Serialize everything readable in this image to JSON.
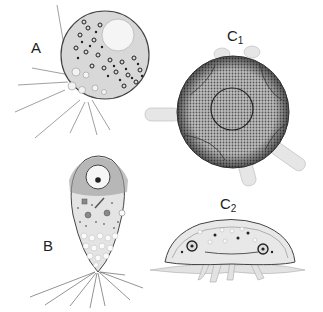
{
  "figure": {
    "panels": [
      {
        "id": "A",
        "label": "A",
        "subscript": "",
        "description": "spherical cell with dense granular cytoplasm, pale nucleus and radiating filopodia"
      },
      {
        "id": "B",
        "label": "B",
        "subscript": "",
        "description": "pear-shaped cell with apical nucleus, vacuolated lower body and basal rhizopodia"
      },
      {
        "id": "C1",
        "label": "C",
        "subscript": "1",
        "description": "dorsal view of round stippled cell with central circle and lobed pseudopodia"
      },
      {
        "id": "C2",
        "label": "C",
        "subscript": "2",
        "description": "lateral view of flattened dome-shaped cell with pseudopodia below"
      }
    ]
  }
}
